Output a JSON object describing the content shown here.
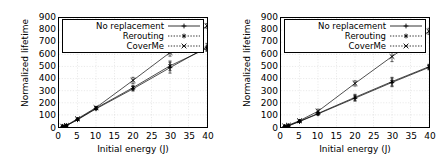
{
  "figure": {
    "panels": [
      {
        "id": "left",
        "chart_data": {
          "type": "line",
          "title": "",
          "xlabel": "Initial energy (J)",
          "ylabel": "Normalized lifetime",
          "xlim": [
            0,
            40
          ],
          "ylim": [
            0,
            900
          ],
          "xticks": [
            0,
            5,
            10,
            15,
            20,
            25,
            30,
            35,
            40
          ],
          "yticks": [
            0,
            100,
            200,
            300,
            400,
            500,
            600,
            700,
            800,
            900
          ],
          "grid": true,
          "legend_position": "top-left",
          "x": [
            1,
            2,
            5,
            10,
            20,
            30,
            40
          ],
          "series": [
            {
              "name": "No replacement",
              "marker": "plus",
              "values": [
                5,
                10,
                60,
                150,
                315,
                490,
                660
              ],
              "errors": [
                2,
                3,
                5,
                8,
                18,
                45,
                30
              ]
            },
            {
              "name": "Rerouting",
              "marker": "asterisk",
              "values": [
                6,
                11,
                62,
                155,
                325,
                505,
                650
              ],
              "errors": [
                2,
                3,
                5,
                10,
                20,
                40,
                25
              ]
            },
            {
              "name": "CoverMe",
              "marker": "cross",
              "values": [
                7,
                13,
                68,
                160,
                385,
                615,
                835
              ],
              "errors": [
                2,
                3,
                6,
                10,
                25,
                30,
                20
              ]
            }
          ]
        }
      },
      {
        "id": "right",
        "chart_data": {
          "type": "line",
          "title": "",
          "xlabel": "Initial energy (J)",
          "ylabel": "Normalized lifetime",
          "xlim": [
            0,
            40
          ],
          "ylim": [
            0,
            900
          ],
          "xticks": [
            0,
            5,
            10,
            15,
            20,
            25,
            30,
            35,
            40
          ],
          "yticks": [
            0,
            100,
            200,
            300,
            400,
            500,
            600,
            700,
            800,
            900
          ],
          "grid": true,
          "legend_position": "top-left",
          "x": [
            1,
            2,
            5,
            10,
            20,
            30,
            40
          ],
          "series": [
            {
              "name": "No replacement",
              "marker": "plus",
              "values": [
                4,
                9,
                45,
                108,
                238,
                368,
                492
              ],
              "errors": [
                2,
                3,
                5,
                10,
                25,
                35,
                20
              ]
            },
            {
              "name": "Rerouting",
              "marker": "asterisk",
              "values": [
                5,
                10,
                47,
                112,
                245,
                375,
                498
              ],
              "errors": [
                2,
                3,
                5,
                10,
                25,
                35,
                20
              ]
            },
            {
              "name": "CoverMe",
              "marker": "cross",
              "values": [
                8,
                15,
                52,
                130,
                360,
                582,
                790
              ],
              "errors": [
                2,
                3,
                8,
                18,
                22,
                42,
                25
              ]
            }
          ]
        }
      }
    ],
    "colors": {
      "axis": "#000000",
      "grid": "#c8c8c8",
      "series": "#000000",
      "background": "#ffffff"
    }
  }
}
